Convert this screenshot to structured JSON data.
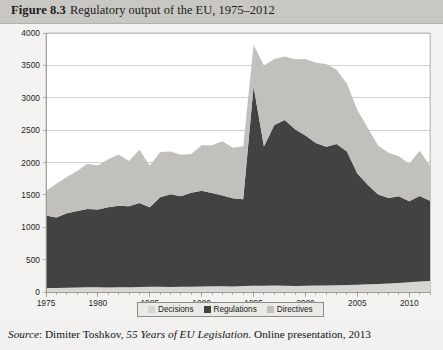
{
  "header": {
    "figure_label": "Figure 8.3",
    "figure_title": "Regulatory output of the EU, 1975–2012"
  },
  "source": {
    "prefix": "Source",
    "separator": ": ",
    "author": "Dimiter Toshkov, ",
    "work_title": "55 Years of EU Legislation",
    "rest": ". Online presentation, 2013"
  },
  "legend": {
    "items": [
      {
        "label": "Decisions",
        "color": "#d8d6d2"
      },
      {
        "label": "Regulations",
        "color": "#424242"
      },
      {
        "label": "Directives",
        "color": "#c2c0bc"
      }
    ]
  },
  "chart_data": {
    "type": "area",
    "stacked": true,
    "title": "Regulatory output of the EU, 1975–2012",
    "xlabel": "",
    "ylabel": "",
    "ylim": [
      0,
      4000
    ],
    "xlim": [
      1975,
      2012
    ],
    "grid": true,
    "legend_position": "bottom",
    "ytick_labels": [
      "0",
      "500",
      "1000",
      "1500",
      "2000",
      "2500",
      "3000",
      "3500",
      "4000"
    ],
    "ytick_values": [
      0,
      500,
      1000,
      1500,
      2000,
      2500,
      3000,
      3500,
      4000
    ],
    "xtick_labels": [
      "1975",
      "1980",
      "1985",
      "1990",
      "1995",
      "2000",
      "2005",
      "2010"
    ],
    "xtick_values": [
      1975,
      1980,
      1985,
      1990,
      1995,
      2000,
      2005,
      2010
    ],
    "x": [
      1975,
      1976,
      1977,
      1978,
      1979,
      1980,
      1981,
      1982,
      1983,
      1984,
      1985,
      1986,
      1987,
      1988,
      1989,
      1990,
      1991,
      1992,
      1993,
      1994,
      1995,
      1996,
      1997,
      1998,
      1999,
      2000,
      2001,
      2002,
      2003,
      2004,
      2005,
      2006,
      2007,
      2008,
      2009,
      2010,
      2011,
      2012
    ],
    "series": [
      {
        "name": "Decisions",
        "color": "#d8d6d2",
        "values": [
          60,
          62,
          65,
          70,
          72,
          75,
          70,
          72,
          74,
          76,
          80,
          82,
          78,
          80,
          82,
          85,
          88,
          90,
          86,
          92,
          95,
          98,
          100,
          96,
          94,
          98,
          100,
          102,
          104,
          108,
          112,
          118,
          124,
          130,
          138,
          150,
          162,
          170
        ]
      },
      {
        "name": "Regulations",
        "color": "#424242",
        "values": [
          1120,
          1090,
          1150,
          1180,
          1210,
          1200,
          1240,
          1260,
          1250,
          1300,
          1230,
          1380,
          1430,
          1400,
          1450,
          1480,
          1440,
          1400,
          1360,
          1340,
          3080,
          2150,
          2480,
          2560,
          2420,
          2320,
          2200,
          2140,
          2180,
          2060,
          1720,
          1540,
          1380,
          1320,
          1340,
          1250,
          1320,
          1240
        ]
      },
      {
        "name": "Directives",
        "color": "#c2c0bc",
        "values": [
          380,
          520,
          560,
          620,
          700,
          680,
          740,
          790,
          700,
          820,
          640,
          700,
          660,
          640,
          600,
          700,
          740,
          840,
          780,
          820,
          640,
          1250,
          1020,
          980,
          1080,
          1180,
          1240,
          1280,
          1150,
          1050,
          980,
          880,
          760,
          700,
          620,
          580,
          700,
          540
        ]
      }
    ]
  }
}
